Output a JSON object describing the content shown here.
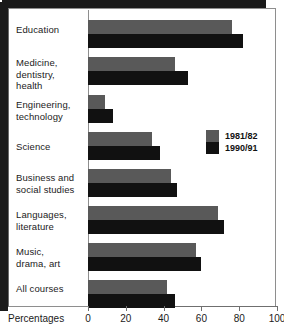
{
  "chart_data": {
    "type": "bar",
    "orientation": "horizontal",
    "title": "",
    "subtitle": "",
    "xlabel": "Percentages",
    "ylabel": "",
    "xlim": [
      0,
      100
    ],
    "xticks": [
      0,
      20,
      40,
      60,
      80,
      100
    ],
    "xtick_labels": [
      "0",
      "20",
      "40",
      "60",
      "80",
      "100"
    ],
    "grid": false,
    "legend_position": "middle-right",
    "categories": [
      "Education",
      "Medicine,\ndentistry,\nhealth",
      "Engineering,\ntechnology",
      "Science",
      "Business and\nsocial studies",
      "Languages,\nliterature",
      "Music,\ndrama, art",
      "All courses"
    ],
    "series": [
      {
        "name": "1981/82",
        "color": "#595959",
        "values": [
          76,
          46,
          9,
          34,
          44,
          69,
          57,
          42
        ]
      },
      {
        "name": "1990/91",
        "color": "#111111",
        "values": [
          82,
          53,
          13,
          38,
          47,
          72,
          60,
          46
        ]
      }
    ]
  },
  "legend": {
    "items": [
      {
        "label": "1981/82",
        "color": "#595959"
      },
      {
        "label": "1990/91",
        "color": "#111111"
      }
    ]
  },
  "axis": {
    "title": "Percentages",
    "ticks": [
      "0",
      "20",
      "40",
      "60",
      "80",
      "100"
    ]
  },
  "colors": {
    "series_1981": "#595959",
    "series_1990": "#111111",
    "frame": "#1a1a1a",
    "background": "#ffffff"
  }
}
